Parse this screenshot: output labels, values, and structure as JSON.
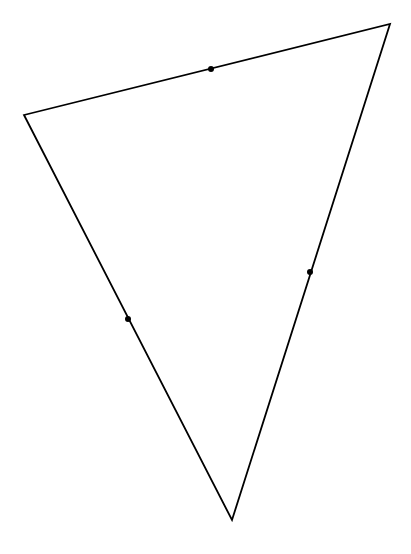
{
  "diagram": {
    "type": "triangle-with-side-points",
    "width": 411,
    "height": 554,
    "background": "#ffffff",
    "stroke_color": "#000000",
    "stroke_width": 1.8,
    "point_color": "#000000",
    "point_radius": 3,
    "vertices": [
      {
        "id": "A",
        "x": 24,
        "y": 115
      },
      {
        "id": "B",
        "x": 390,
        "y": 24
      },
      {
        "id": "C",
        "x": 232,
        "y": 520
      }
    ],
    "points": [
      {
        "id": "P_AB",
        "side": "AB",
        "x": 211,
        "y": 69
      },
      {
        "id": "P_BC",
        "side": "BC",
        "x": 310,
        "y": 272
      },
      {
        "id": "P_CA",
        "side": "CA",
        "x": 128,
        "y": 319
      }
    ],
    "labels": []
  }
}
